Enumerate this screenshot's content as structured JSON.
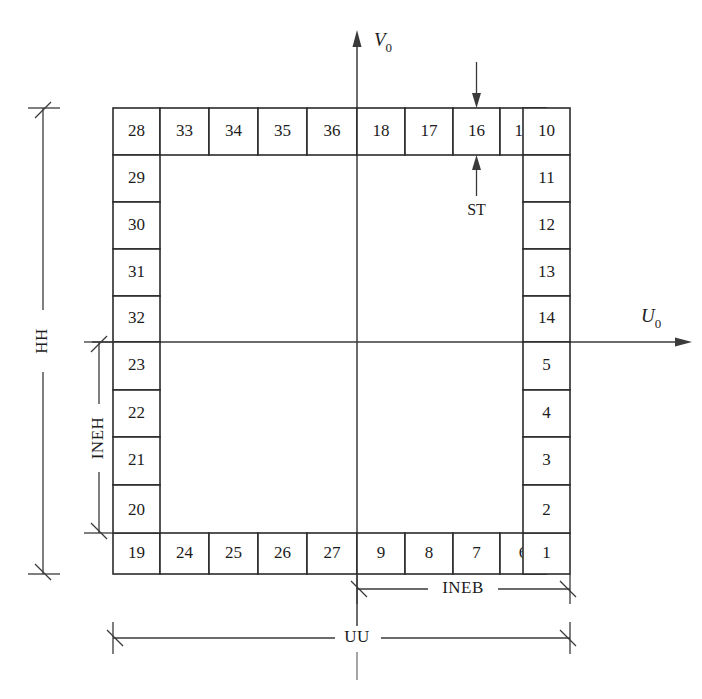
{
  "figure": {
    "type": "engineering-cross-section-diagram",
    "background_color": "#ffffff",
    "line_color": "#2b2b2b"
  },
  "axes": {
    "vertical": {
      "name": "V0",
      "label_main": "V",
      "label_sub": "0",
      "direction": "up"
    },
    "horizontal": {
      "name": "U0",
      "label_main": "U",
      "label_sub": "0",
      "direction": "right"
    },
    "origin_note": "axes cross at the section centroid"
  },
  "cells": {
    "top_row": [
      "28",
      "33",
      "34",
      "35",
      "36",
      "18",
      "17",
      "16",
      "15",
      "10"
    ],
    "bottom_row": [
      "19",
      "24",
      "25",
      "26",
      "27",
      "9",
      "8",
      "7",
      "6",
      "1"
    ],
    "left_column_upper": [
      "29",
      "30",
      "31",
      "32"
    ],
    "left_column_lower": [
      "23",
      "22",
      "21",
      "20"
    ],
    "right_column_upper": [
      "11",
      "12",
      "13",
      "14"
    ],
    "right_column_lower": [
      "5",
      "4",
      "3",
      "2"
    ],
    "total_count": 36
  },
  "dimensions": [
    {
      "id": "HH",
      "label": "HH",
      "orientation": "vertical",
      "span": "full overall height, left of section"
    },
    {
      "id": "INEH",
      "label": "INEH",
      "orientation": "vertical",
      "span": "from horizontal axis down to bottom edge"
    },
    {
      "id": "UU",
      "label": "UU",
      "orientation": "horizontal",
      "span": "full overall width, below section"
    },
    {
      "id": "INEB",
      "label": "INEB",
      "orientation": "horizontal",
      "span": "from vertical axis right to right edge"
    },
    {
      "id": "ST",
      "label": "ST",
      "orientation": "vertical",
      "span": "wall thickness of top flange, indicated at cell 16"
    }
  ]
}
